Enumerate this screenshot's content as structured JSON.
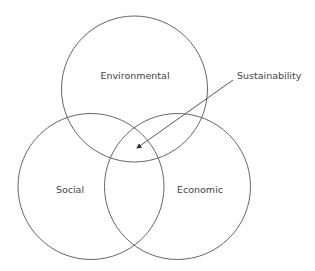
{
  "diagram": {
    "type": "venn",
    "circles": [
      {
        "id": "environmental",
        "label": "Environmental",
        "cx": 134.5,
        "cy": 89,
        "r": 73
      },
      {
        "id": "social",
        "label": "Social",
        "cx": 91,
        "cy": 186.5,
        "r": 73
      },
      {
        "id": "economic",
        "label": "Economic",
        "cx": 177.5,
        "cy": 186.5,
        "r": 73
      }
    ],
    "annotation": {
      "label": "Sustainability",
      "points_to": "center intersection"
    },
    "stroke_color": "#555555"
  }
}
